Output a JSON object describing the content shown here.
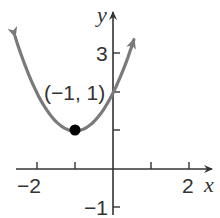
{
  "chart_data": {
    "type": "line",
    "title": "",
    "xlabel": "x",
    "ylabel": "y",
    "xlim": [
      -2.9,
      2.9
    ],
    "ylim": [
      -1.3,
      4.4
    ],
    "x_ticks": [
      -2,
      -1,
      1,
      2
    ],
    "x_tick_labels": [
      "-2",
      "2"
    ],
    "y_ticks": [
      -1,
      1,
      2,
      3
    ],
    "y_tick_labels": [
      "-1",
      "3"
    ],
    "grid": false,
    "series": [
      {
        "name": "parabola",
        "equation": "y = (x + 1)^2 + 1",
        "x": [
          -2.58,
          -2.5,
          -2,
          -1.5,
          -1,
          -0.5,
          0,
          0.5,
          0.55
        ],
        "y": [
          3.5,
          3.25,
          2,
          1.25,
          1,
          1.25,
          2,
          3.25,
          3.4
        ],
        "color": "#7a7a7a",
        "arrows_at_ends": true
      }
    ],
    "annotations": [
      {
        "text": "(−1, 1)",
        "point": [
          -1,
          1
        ],
        "marker": "filled-circle",
        "color": "#000000"
      }
    ]
  },
  "labels": {
    "x_axis": "x",
    "y_axis": "y",
    "x_neg2": "−2",
    "x_pos2": "2",
    "y_pos3": "3",
    "y_neg1": "−1",
    "vertex": "(−1, 1)"
  },
  "colors": {
    "axis": "#333333",
    "curve": "#7a7a7a",
    "point": "#000000"
  }
}
